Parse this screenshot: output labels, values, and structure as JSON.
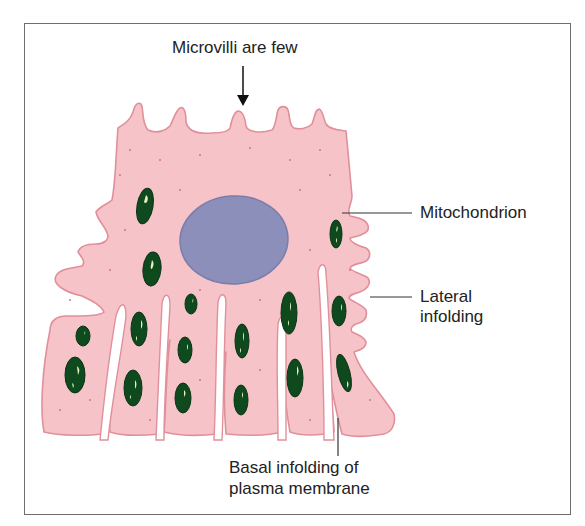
{
  "figure": {
    "title_label": "Microvilli are few",
    "labels": {
      "mitochondrion": "Mitochondrion",
      "lateral_line1": "Lateral",
      "lateral_line2": "infolding",
      "basal_line1": "Basal infolding of",
      "basal_line2": "plasma membrane"
    },
    "colors": {
      "cytoplasm": "#f6c3c8",
      "membrane": "#e0909a",
      "nucleus": "#8c8fba",
      "nucleus_edge": "#7a7daa",
      "mitochondrion": "#0f4a1f",
      "mito_highlight": "#e9f1c4",
      "frame": "#6e6e6e",
      "leader_line": "#333333"
    },
    "structures": [
      "cell membrane",
      "microvilli",
      "nucleus",
      "mitochondria",
      "lateral infoldings",
      "basal infoldings"
    ]
  }
}
